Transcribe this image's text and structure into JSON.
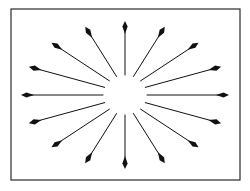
{
  "figure": {
    "background_color": "#ffffff",
    "stroke_color": "#1a1a1a",
    "canvas": {
      "width": 250,
      "height": 191
    }
  },
  "frame": {
    "name": "outer-border",
    "x": 11,
    "y": 9,
    "width": 229,
    "height": 171,
    "stroke_width": 1.2,
    "stroke_color": "#2b2b2b",
    "fill": "none"
  },
  "burst": {
    "name": "radial-arrow-burst",
    "center_x": 125,
    "center_y": 95,
    "arrow_count": 16,
    "angle_step_degrees": 22.5,
    "start_angle_degrees": -90,
    "inner_radius_x": 22,
    "inner_radius_y": 20,
    "outer_radius_x": 104,
    "outer_radius_y": 74,
    "shaft_width": 1.0,
    "head_length": 13,
    "head_half_width": 2.6,
    "color": "#111111",
    "direction": "outward",
    "arrows": [
      {
        "index": 0,
        "angle": -90.0,
        "label": "arrow-up"
      },
      {
        "index": 1,
        "angle": -67.5,
        "label": "arrow-up-right-1"
      },
      {
        "index": 2,
        "angle": -45.0,
        "label": "arrow-up-right-2"
      },
      {
        "index": 3,
        "angle": -22.5,
        "label": "arrow-up-right-3"
      },
      {
        "index": 4,
        "angle": 0.0,
        "label": "arrow-right"
      },
      {
        "index": 5,
        "angle": 22.5,
        "label": "arrow-down-right-1"
      },
      {
        "index": 6,
        "angle": 45.0,
        "label": "arrow-down-right-2"
      },
      {
        "index": 7,
        "angle": 67.5,
        "label": "arrow-down-right-3"
      },
      {
        "index": 8,
        "angle": 90.0,
        "label": "arrow-down"
      },
      {
        "index": 9,
        "angle": 112.5,
        "label": "arrow-down-left-1"
      },
      {
        "index": 10,
        "angle": 135.0,
        "label": "arrow-down-left-2"
      },
      {
        "index": 11,
        "angle": 157.5,
        "label": "arrow-down-left-3"
      },
      {
        "index": 12,
        "angle": 180.0,
        "label": "arrow-left"
      },
      {
        "index": 13,
        "angle": 202.5,
        "label": "arrow-up-left-1"
      },
      {
        "index": 14,
        "angle": 225.0,
        "label": "arrow-up-left-2"
      },
      {
        "index": 15,
        "angle": 247.5,
        "label": "arrow-up-left-3"
      }
    ]
  }
}
